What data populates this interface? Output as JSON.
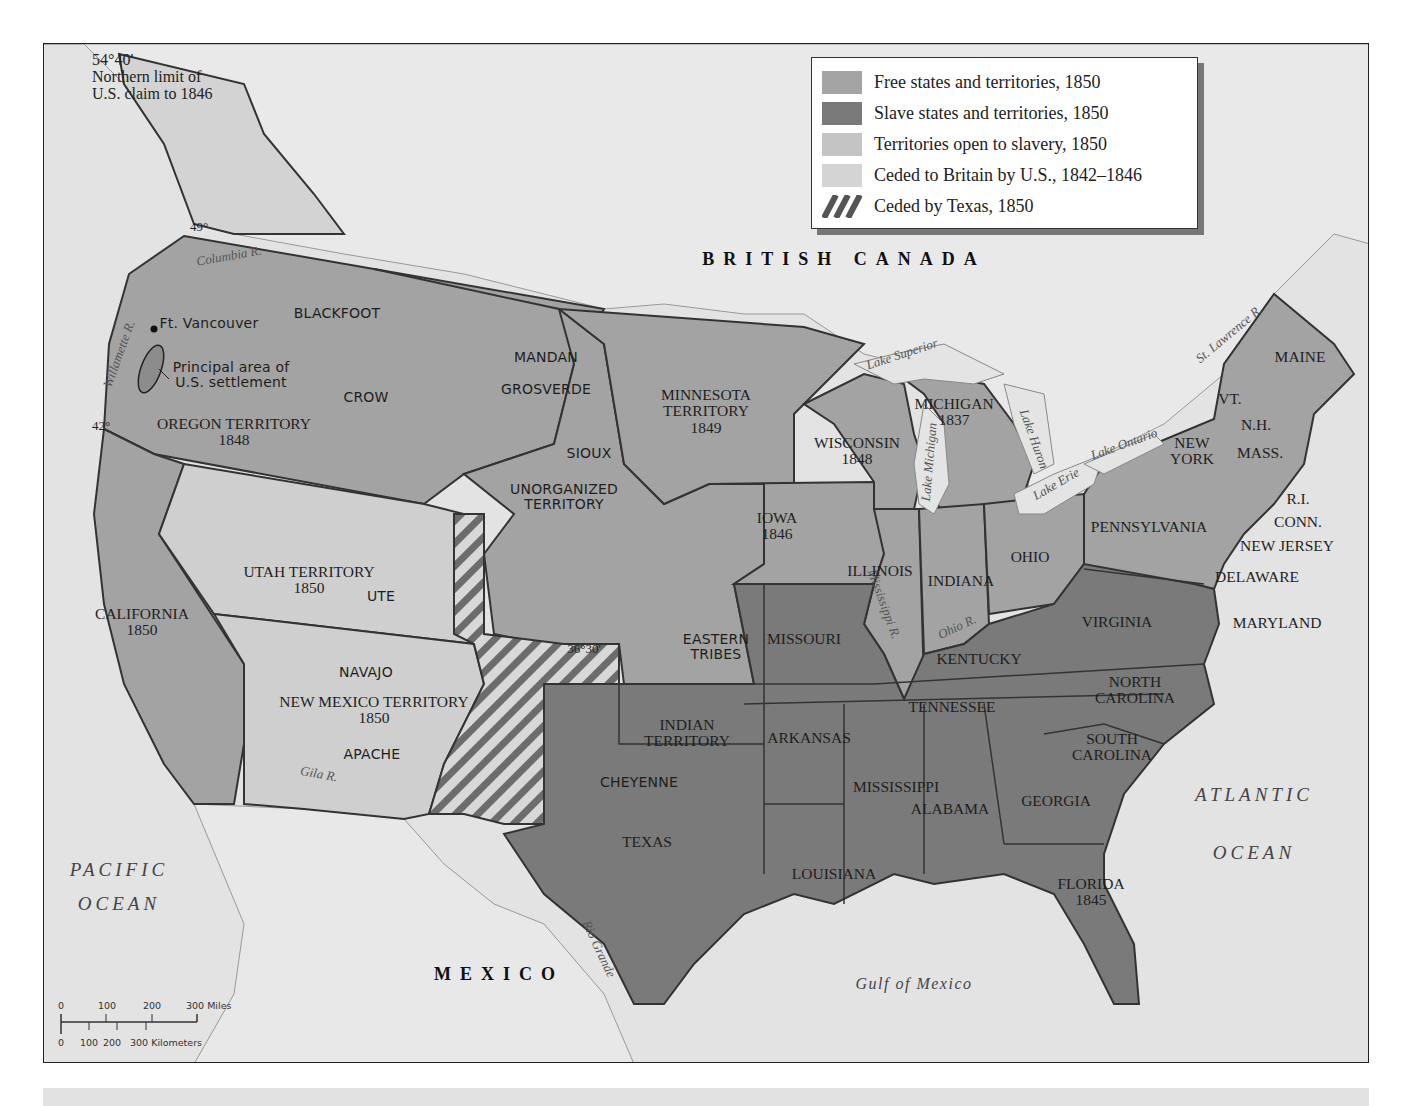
{
  "colors": {
    "water": "#e4e4e4",
    "foreign_land": "#e8e8e8",
    "free": "#a4a4a4",
    "slave": "#7a7a7a",
    "open_to_slavery": "#cfcfcf",
    "ceded_britain": "#d4d4d4",
    "border": "#333333",
    "river": "#8a8a8a"
  },
  "legend": {
    "items": [
      {
        "label": "Free states and territories, 1850",
        "swatch": "free"
      },
      {
        "label": "Slave states and territories, 1850",
        "swatch": "slave"
      },
      {
        "label": "Territories open to slavery, 1850",
        "swatch": "open_to_slavery"
      },
      {
        "label": "Ceded to Britain by U.S., 1842–1846",
        "swatch": "ceded_britain"
      },
      {
        "label": "Ceded by Texas, 1850",
        "swatch": "hatch"
      }
    ]
  },
  "annotations": {
    "northern_limit": {
      "line1": "54°40'",
      "line2": "Northern limit of",
      "line3": "U.S. claim to 1846"
    },
    "parallel_49": "49°",
    "parallel_42": "42°",
    "parallel_3630": "36°30'",
    "ft_vancouver": "Ft. Vancouver",
    "settlement": {
      "line1": "Principal area of",
      "line2": "U.S. settlement"
    }
  },
  "countries": {
    "british_canada": "BRITISH CANADA",
    "mexico": "MEXICO"
  },
  "oceans": {
    "pacific": {
      "line1": "PACIFIC",
      "line2": "OCEAN"
    },
    "atlantic": {
      "line1": "ATLANTIC",
      "line2": "OCEAN"
    },
    "gulf": "Gulf of Mexico"
  },
  "rivers": {
    "columbia": "Columbia R.",
    "willamette": "Willamette R.",
    "st_lawrence": "St. Lawrence R.",
    "mississippi": "Mississippi R.",
    "ohio": "Ohio R.",
    "gila": "Gila R.",
    "rio_grande": "Rio Grande"
  },
  "lakes": {
    "superior": "Lake Superior",
    "michigan": "Lake Michigan",
    "huron": "Lake Huron",
    "erie": "Lake Erie",
    "ontario": "Lake Ontario"
  },
  "tribes": [
    "BLACKFOOT",
    "CROW",
    "MANDAN",
    "GROSVERDE",
    "SIOUX",
    "UTE",
    "NAVAJO",
    "APACHE",
    "CHEYENNE",
    "EASTERN TRIBES"
  ],
  "regions": {
    "oregon": {
      "name": "OREGON TERRITORY",
      "year": "1848",
      "status": "free"
    },
    "minnesota": {
      "name": "MINNESOTA TERRITORY",
      "year": "1849",
      "status": "free"
    },
    "unorganized": {
      "name": "UNORGANIZED TERRITORY",
      "status": "free"
    },
    "california": {
      "name": "CALIFORNIA",
      "year": "1850",
      "status": "free"
    },
    "utah": {
      "name": "UTAH TERRITORY",
      "year": "1850",
      "status": "open_to_slavery"
    },
    "new_mexico": {
      "name": "NEW MEXICO TERRITORY",
      "year": "1850",
      "status": "open_to_slavery"
    },
    "iowa": {
      "name": "IOWA",
      "year": "1846",
      "status": "free"
    },
    "wisconsin": {
      "name": "WISCONSIN",
      "year": "1848",
      "status": "free"
    },
    "michigan": {
      "name": "MICHIGAN",
      "year": "1837",
      "status": "free"
    },
    "illinois": {
      "name": "ILLINOIS",
      "status": "free"
    },
    "indiana": {
      "name": "INDIANA",
      "status": "free"
    },
    "ohio": {
      "name": "OHIO",
      "status": "free"
    },
    "pennsylvania": {
      "name": "PENNSYLVANIA",
      "status": "free"
    },
    "new_york": {
      "name": "NEW YORK",
      "status": "free"
    },
    "new_jersey": {
      "name": "NEW JERSEY",
      "status": "free"
    },
    "vermont": {
      "name": "VT.",
      "status": "free"
    },
    "new_hampshire": {
      "name": "N.H.",
      "status": "free"
    },
    "massachusetts": {
      "name": "MASS.",
      "status": "free"
    },
    "rhode_island": {
      "name": "R.I.",
      "status": "free"
    },
    "connecticut": {
      "name": "CONN.",
      "status": "free"
    },
    "maine": {
      "name": "MAINE",
      "status": "free"
    },
    "missouri": {
      "name": "MISSOURI",
      "status": "slave"
    },
    "arkansas": {
      "name": "ARKANSAS",
      "status": "slave"
    },
    "louisiana": {
      "name": "LOUISIANA",
      "status": "slave"
    },
    "texas": {
      "name": "TEXAS",
      "status": "slave"
    },
    "indian_territory": {
      "name": "INDIAN TERRITORY",
      "status": "slave"
    },
    "kentucky": {
      "name": "KENTUCKY",
      "status": "slave"
    },
    "tennessee": {
      "name": "TENNESSEE",
      "status": "slave"
    },
    "mississippi": {
      "name": "MISSISSIPPI",
      "status": "slave"
    },
    "alabama": {
      "name": "ALABAMA",
      "status": "slave"
    },
    "georgia": {
      "name": "GEORGIA",
      "status": "slave"
    },
    "florida": {
      "name": "FLORIDA",
      "year": "1845",
      "status": "slave"
    },
    "south_carolina": {
      "name": "SOUTH CAROLINA",
      "status": "slave"
    },
    "north_carolina": {
      "name": "NORTH CAROLINA",
      "status": "slave"
    },
    "virginia": {
      "name": "VIRGINIA",
      "status": "slave"
    },
    "maryland": {
      "name": "MARYLAND",
      "status": "slave"
    },
    "delaware": {
      "name": "DELAWARE",
      "status": "slave"
    }
  },
  "scale_bar": {
    "miles": [
      "0",
      "100",
      "200",
      "300 Miles"
    ],
    "kilometers": [
      "0",
      "100",
      "200",
      "300 Kilometers"
    ]
  }
}
